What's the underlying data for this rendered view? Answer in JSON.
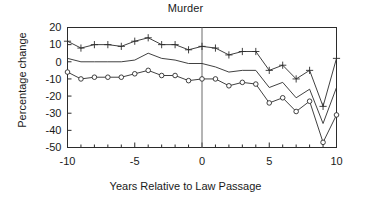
{
  "chart_data": {
    "type": "line",
    "title": "Murder",
    "xlabel": "Years Relative to Law Passage",
    "ylabel": "Percentage change",
    "xlim": [
      -10,
      10
    ],
    "ylim": [
      -50,
      20
    ],
    "xticks": [
      -10,
      -5,
      0,
      5,
      10
    ],
    "xticklabels": [
      "-10",
      "-5",
      "0",
      "5",
      "10"
    ],
    "yticks": [
      20,
      10,
      0,
      -10,
      -20,
      -30,
      -40,
      -50
    ],
    "yticklabels": [
      "20",
      "10",
      "0",
      "-10",
      "-20",
      "-30",
      "-40",
      "-50"
    ],
    "grid": false,
    "legend": "none",
    "annotations": [
      {
        "type": "vertical-reference-line",
        "x": 0,
        "label": "law passage year"
      }
    ],
    "x": [
      -10,
      -9,
      -8,
      -7,
      -6,
      -5,
      -4,
      -3,
      -2,
      -1,
      0,
      1,
      2,
      3,
      4,
      5,
      6,
      7,
      8,
      9,
      10
    ],
    "series": [
      {
        "name": "upper-bound",
        "marker": "plus",
        "values": [
          12,
          8,
          10,
          10,
          9,
          12,
          14,
          10,
          10,
          7,
          9,
          8,
          4,
          6,
          6,
          -5,
          -2,
          -10,
          -5,
          -26,
          2
        ]
      },
      {
        "name": "point-estimate",
        "marker": "none",
        "values": [
          2,
          0,
          0,
          0,
          0,
          1,
          5,
          2,
          1,
          -1,
          -1,
          -3,
          -6,
          -5,
          -5,
          -15,
          -12,
          -21,
          -16,
          -36,
          -15
        ]
      },
      {
        "name": "lower-bound",
        "marker": "circle",
        "values": [
          -6,
          -10,
          -9,
          -9,
          -9,
          -7,
          -5,
          -8,
          -8,
          -11,
          -10,
          -10,
          -14,
          -12,
          -13,
          -24,
          -21,
          -29,
          -23,
          -47,
          -31
        ]
      }
    ]
  }
}
